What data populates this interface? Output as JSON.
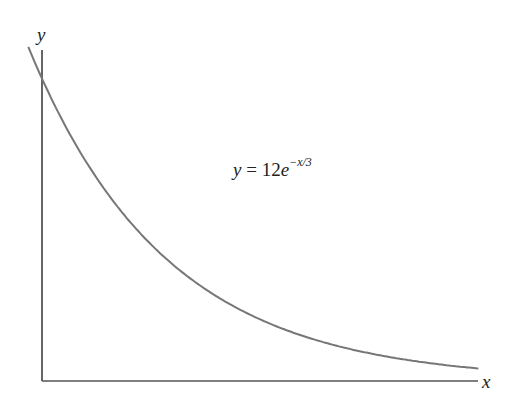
{
  "chart_data": {
    "type": "line",
    "title": "",
    "equation": "y = 12e^{-x/3}",
    "xlabel": "x",
    "ylabel": "y",
    "grid": false,
    "legend": null,
    "annotations": [
      {
        "text": "y = 12e^{-x/3}",
        "position": "upper-middle"
      }
    ],
    "function": {
      "a": 12,
      "k": 3
    },
    "x": [
      -0.3,
      0,
      1,
      2,
      3,
      4,
      5,
      6,
      7,
      8,
      9,
      9.5
    ],
    "series": [
      {
        "name": "y = 12e^(-x/3)",
        "values": [
          13.26,
          12.0,
          8.6,
          6.16,
          4.41,
          3.16,
          2.27,
          1.62,
          1.16,
          0.83,
          0.6,
          0.51
        ]
      }
    ],
    "xlim": [
      -0.3,
      9.6
    ],
    "ylim": [
      0,
      13.3
    ]
  },
  "labels": {
    "x_axis": "x",
    "y_axis": "y",
    "eq_lhs": "y",
    "eq_mid": " = 12",
    "eq_base": "e",
    "eq_exp": "−x/3"
  },
  "colors": {
    "axis": "#333333",
    "curve": "#777777"
  }
}
